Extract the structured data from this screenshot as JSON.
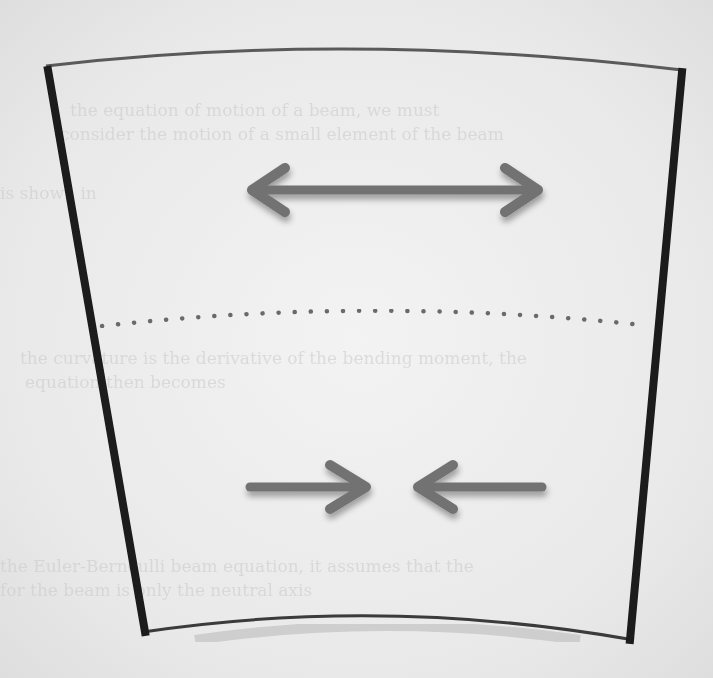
{
  "diagram": {
    "elements": {
      "top_surface": {
        "shape": "convex arc",
        "meaning": "outer fiber (lengthened)"
      },
      "bottom_surface": {
        "shape": "convex arc",
        "meaning": "inner fiber (shortened)"
      },
      "left_edge": {
        "shape": "thick straight line",
        "meaning": "cross-section plane"
      },
      "right_edge": {
        "shape": "thick straight line",
        "meaning": "cross-section plane"
      },
      "neutral_axis": {
        "shape": "dotted arc",
        "meaning": "neutral surface"
      },
      "tension_arrow": {
        "shape": "double-headed arrow",
        "direction": "outward",
        "meaning": "tension / elongation"
      },
      "compression_arrows": {
        "shape": "two arrows pointing inward",
        "direction": "inward",
        "meaning": "compression / shortening"
      }
    },
    "colors": {
      "edge": "#1a1a1a",
      "surface": "#5a5a5a",
      "arrow": "#727272",
      "dots": "#6a6a6a",
      "paper": "#efefef"
    }
  },
  "bleed_through_text": [
    "the equation of motion of a beam, we must",
    "consider the motion of a small element of the beam",
    "is shown in",
    "the curvature is the derivative of the bending moment, the",
    "equation then becomes",
    "the Euler-Bernoulli beam equation, it assumes that the",
    "for the beam is only the neutral axis"
  ]
}
